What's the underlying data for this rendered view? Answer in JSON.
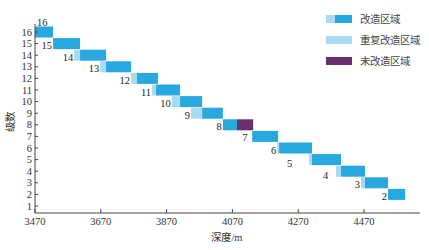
{
  "chart_data": {
    "type": "bar",
    "subtype": "horizontal-range-gantt",
    "title": "",
    "xlabel": "深度/m",
    "ylabel": "级数",
    "xlim": [
      3470,
      4620
    ],
    "ylim": [
      0.5,
      16.5
    ],
    "xticks": [
      3470,
      3670,
      3870,
      4070,
      4270,
      4470
    ],
    "yticks": [
      1,
      2,
      3,
      4,
      5,
      6,
      7,
      8,
      9,
      10,
      11,
      12,
      13,
      14,
      15,
      16
    ],
    "grid": false,
    "legend_position": "top-right",
    "colors": {
      "modified": "#29a8e0",
      "repeat_modified": "#a8daf3",
      "unmodified": "#6b2f6e"
    },
    "legend": [
      {
        "key": "modified",
        "label": "改造区域"
      },
      {
        "key": "repeat_modified",
        "label": "重复改造区域"
      },
      {
        "key": "unmodified",
        "label": "未改造区域"
      }
    ],
    "stages": [
      {
        "stage": 16,
        "label": "16",
        "segments": [
          {
            "type": "modified",
            "start": 3470,
            "end": 3525
          }
        ]
      },
      {
        "stage": 15,
        "label": "15",
        "segments": [
          {
            "type": "modified",
            "start": 3525,
            "end": 3607
          }
        ]
      },
      {
        "stage": 14,
        "label": "14",
        "segments": [
          {
            "type": "repeat_modified",
            "start": 3589,
            "end": 3607
          },
          {
            "type": "modified",
            "start": 3607,
            "end": 3686
          }
        ]
      },
      {
        "stage": 13,
        "label": "13",
        "segments": [
          {
            "type": "repeat_modified",
            "start": 3668,
            "end": 3686
          },
          {
            "type": "modified",
            "start": 3686,
            "end": 3762
          }
        ]
      },
      {
        "stage": 12,
        "label": "12",
        "segments": [
          {
            "type": "repeat_modified",
            "start": 3762,
            "end": 3780
          },
          {
            "type": "modified",
            "start": 3780,
            "end": 3844
          }
        ]
      },
      {
        "stage": 11,
        "label": "11",
        "segments": [
          {
            "type": "repeat_modified",
            "start": 3826,
            "end": 3838
          },
          {
            "type": "modified",
            "start": 3838,
            "end": 3911
          }
        ]
      },
      {
        "stage": 10,
        "label": "10",
        "segments": [
          {
            "type": "repeat_modified",
            "start": 3886,
            "end": 3911
          },
          {
            "type": "modified",
            "start": 3911,
            "end": 3978
          }
        ]
      },
      {
        "stage": 9,
        "label": "9",
        "segments": [
          {
            "type": "repeat_modified",
            "start": 3944,
            "end": 3978
          },
          {
            "type": "modified",
            "start": 3978,
            "end": 4041
          }
        ]
      },
      {
        "stage": 8,
        "label": "8",
        "segments": [
          {
            "type": "modified",
            "start": 4041,
            "end": 4084
          },
          {
            "type": "unmodified",
            "start": 4084,
            "end": 4133
          }
        ]
      },
      {
        "stage": 7,
        "label": "7",
        "segments": [
          {
            "type": "modified",
            "start": 4130,
            "end": 4209
          }
        ]
      },
      {
        "stage": 6,
        "label": "6",
        "segments": [
          {
            "type": "repeat_modified",
            "start": 4206,
            "end": 4212
          },
          {
            "type": "modified",
            "start": 4212,
            "end": 4312
          }
        ]
      },
      {
        "stage": 5,
        "label": "5",
        "segments": [
          {
            "type": "repeat_modified",
            "start": 4303,
            "end": 4312
          },
          {
            "type": "modified",
            "start": 4312,
            "end": 4400
          }
        ]
      },
      {
        "stage": 4,
        "label": "4",
        "segments": [
          {
            "type": "repeat_modified",
            "start": 4385,
            "end": 4400
          },
          {
            "type": "modified",
            "start": 4400,
            "end": 4473
          }
        ]
      },
      {
        "stage": 3,
        "label": "3",
        "segments": [
          {
            "type": "repeat_modified",
            "start": 4461,
            "end": 4473
          },
          {
            "type": "modified",
            "start": 4473,
            "end": 4543
          }
        ]
      },
      {
        "stage": 2,
        "label": "2",
        "segments": [
          {
            "type": "modified",
            "start": 4543,
            "end": 4595
          }
        ]
      }
    ]
  }
}
